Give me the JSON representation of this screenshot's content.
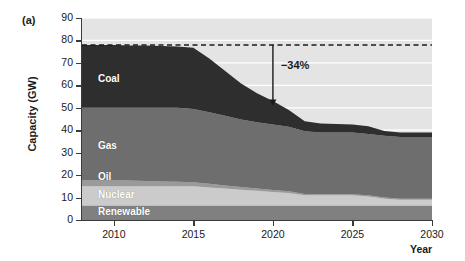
{
  "figure": {
    "panel_letter": "(a)",
    "y_axis_title": "Capacity (GW)",
    "x_axis_title": "Year"
  },
  "chart_data": {
    "type": "area",
    "title": "",
    "xlabel": "Year",
    "ylabel": "Capacity (GW)",
    "xlim": [
      2008,
      2030
    ],
    "ylim": [
      0,
      90
    ],
    "yticks": [
      0,
      10,
      20,
      30,
      40,
      50,
      60,
      70,
      80,
      90
    ],
    "xticks": [
      2010,
      2015,
      2020,
      2025,
      2030
    ],
    "grid": true,
    "stacked": true,
    "legend": "in-plot labels",
    "x": [
      2008,
      2009,
      2010,
      2011,
      2012,
      2013,
      2014,
      2015,
      2016,
      2017,
      2018,
      2019,
      2020,
      2021,
      2022,
      2023,
      2024,
      2025,
      2026,
      2027,
      2028,
      2029,
      2030
    ],
    "series": [
      {
        "name": "Renewable",
        "color": "#808080",
        "values": [
          6.5,
          6.5,
          6.5,
          6.5,
          6.5,
          6.5,
          6.5,
          6.5,
          6.5,
          6.5,
          6.5,
          6.5,
          6.5,
          6.5,
          6.5,
          6.5,
          6.5,
          6.5,
          6.5,
          6.5,
          6.5,
          6.5,
          6.5
        ]
      },
      {
        "name": "Nuclear",
        "color": "#cbcbcb",
        "values": [
          8.5,
          8.5,
          8.5,
          8.5,
          8.5,
          8.5,
          8.5,
          8.5,
          8.0,
          7.5,
          7.0,
          6.5,
          6.0,
          5.5,
          4.5,
          4.5,
          4.5,
          4.5,
          4.0,
          3.0,
          2.5,
          2.5,
          2.5
        ]
      },
      {
        "name": "Oil",
        "color": "#9a9a9a",
        "values": [
          2.8,
          2.8,
          2.8,
          2.6,
          2.4,
          2.2,
          2.0,
          1.8,
          1.6,
          1.4,
          1.2,
          1.0,
          0.9,
          0.8,
          0.6,
          0.5,
          0.5,
          0.5,
          0.5,
          0.5,
          0.5,
          0.5,
          0.5
        ]
      },
      {
        "name": "Gas",
        "color": "#6e6e6e",
        "values": [
          32.2,
          32.2,
          32.2,
          32.4,
          32.6,
          32.8,
          33.0,
          32.7,
          31.9,
          31.0,
          30.1,
          29.5,
          29.1,
          28.7,
          27.9,
          27.5,
          27.5,
          27.5,
          27.3,
          27.5,
          27.5,
          27.5,
          27.5
        ]
      },
      {
        "name": "Coal",
        "color": "#2e2e2e",
        "values": [
          28.0,
          28.0,
          28.0,
          27.8,
          27.7,
          27.5,
          27.3,
          27.3,
          24.0,
          20.0,
          16.0,
          13.0,
          10.5,
          7.5,
          4.5,
          4.0,
          3.8,
          3.6,
          3.5,
          2.2,
          2.0,
          2.0,
          2.0
        ]
      }
    ],
    "totals": [
      78.0,
      78.0,
      78.0,
      77.8,
      77.7,
      77.5,
      77.3,
      76.8,
      72.0,
      66.4,
      60.8,
      56.5,
      53.0,
      49.0,
      44.0,
      43.0,
      42.8,
      42.6,
      41.8,
      39.7,
      39.0,
      39.0,
      39.0
    ],
    "reference_line": {
      "label": "",
      "value": 78,
      "style": "dashed",
      "color": "#1a1a1a"
    },
    "annotations": [
      {
        "text": "−34%",
        "x": 2020,
        "y_from": 78,
        "y_to": 51,
        "arrow": "down"
      }
    ],
    "series_labels": [
      {
        "name": "Coal",
        "x": 2009.0,
        "y": 63
      },
      {
        "name": "Gas",
        "x": 2009.0,
        "y": 33
      },
      {
        "name": "Oil",
        "x": 2009.0,
        "y": 19
      },
      {
        "name": "Nuclear",
        "x": 2009.0,
        "y": 11
      },
      {
        "name": "Renewable",
        "x": 2009.0,
        "y": 3.5
      }
    ],
    "background_color": "#e4e4e4",
    "gridline_color": "#ffffff"
  }
}
